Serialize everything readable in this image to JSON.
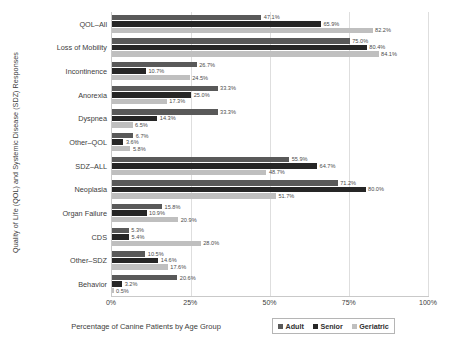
{
  "chart_data": {
    "type": "bar",
    "orientation": "horizontal",
    "title": "",
    "xlabel": "Percentage of Canine Patients by Age Group",
    "ylabel": "Quality of Life (QOL) and Systemic Disease (SDZ) Responses",
    "xlim": [
      0,
      100
    ],
    "xticks": [
      "0%",
      "25%",
      "50%",
      "75%",
      "100%"
    ],
    "xtick_values": [
      0,
      25,
      50,
      75,
      100
    ],
    "grid": true,
    "legend_position": "bottom-right",
    "categories": [
      "QOL–All",
      "Loss of Mobility",
      "Incontinence",
      "Anorexia",
      "Dyspnea",
      "Other–QOL",
      "SDZ–ALL",
      "Neoplasia",
      "Organ Failure",
      "CDS",
      "Other–SDZ",
      "Behavior"
    ],
    "series": [
      {
        "name": "Adult",
        "color": "#595959",
        "values": [
          47.1,
          75.0,
          26.7,
          33.3,
          33.3,
          6.7,
          55.9,
          71.2,
          15.8,
          5.3,
          10.5,
          20.6
        ],
        "labels": [
          "47.1%",
          "75.0%",
          "26.7%",
          "33.3%",
          "33.3%",
          "6.7%",
          "55.9%",
          "71.2%",
          "15.8%",
          "5.3%",
          "10.5%",
          "20.6%"
        ]
      },
      {
        "name": "Senior",
        "color": "#262626",
        "values": [
          65.9,
          80.4,
          10.7,
          25.0,
          14.3,
          3.6,
          64.7,
          80.0,
          10.9,
          5.4,
          14.6,
          3.2
        ],
        "labels": [
          "65.9%",
          "80.4%",
          "10.7%",
          "25.0%",
          "14.3%",
          "3.6%",
          "64.7%",
          "80.0%",
          "10.9%",
          "5.4%",
          "14.6%",
          "3.2%"
        ]
      },
      {
        "name": "Geriatric",
        "color": "#bfbfbf",
        "values": [
          82.2,
          84.1,
          24.5,
          17.3,
          6.5,
          5.8,
          48.7,
          51.7,
          20.9,
          28.0,
          17.6,
          0.5
        ],
        "labels": [
          "82.2%",
          "84.1%",
          "24.5%",
          "17.3%",
          "6.5%",
          "5.8%",
          "48.7%",
          "51.7%",
          "20.9%",
          "28.0%",
          "17.6%",
          "0.5%"
        ]
      }
    ]
  },
  "legend": {
    "items": [
      {
        "label": "Adult"
      },
      {
        "label": "Senior"
      },
      {
        "label": "Geriatric"
      }
    ]
  }
}
